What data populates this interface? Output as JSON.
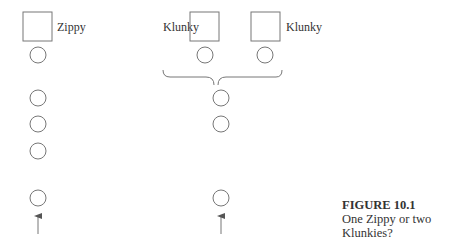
{
  "figure": {
    "number_label": "FIGURE 10.1",
    "caption": "One Zippy or two Klunkies?"
  },
  "left_group": {
    "creature_label": "Zippy",
    "creature_count": 1,
    "circle_count": 5,
    "has_arrow": true
  },
  "right_group": {
    "creature_left_label": "Klunky",
    "creature_right_label": "Klunky",
    "creature_count": 2,
    "circles_under_creatures": 2,
    "merged_circle_count": 3,
    "has_brace": true,
    "has_arrow": true
  },
  "colors": {
    "stroke": "#777777",
    "text": "#333333",
    "background": "#ffffff"
  }
}
